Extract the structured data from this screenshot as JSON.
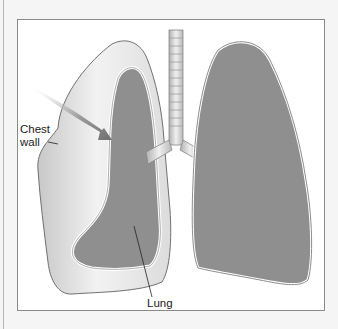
{
  "figure": {
    "labels": {
      "chest_wall_line1": "Chest",
      "chest_wall_line2": "wall",
      "lung": "Lung"
    },
    "colors": {
      "background": "#f5f5f5",
      "frame_border": "#8a8a8a",
      "lung_fill": "#8f8f8f",
      "pleural_space": "#e6e6e6",
      "arrow": "#7d7d7d"
    }
  }
}
